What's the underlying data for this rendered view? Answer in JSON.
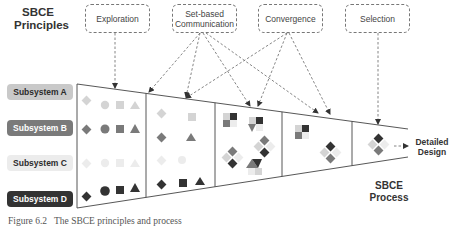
{
  "principles_title": "SBCE\nPrinciples",
  "principles_title_lines": [
    "SBCE",
    "Principles"
  ],
  "principles": [
    {
      "label": "Exploration"
    },
    {
      "label_lines": [
        "Set-based",
        "Communication"
      ]
    },
    {
      "label": "Convergence"
    },
    {
      "label": "Selection"
    }
  ],
  "subsystems": [
    {
      "label": "Subsystem A",
      "bg": "#c9c9c9",
      "fg": "#2b2b2b"
    },
    {
      "label": "Subsystem B",
      "bg": "#7a7a7a",
      "fg": "#ffffff"
    },
    {
      "label": "Subsystem C",
      "bg": "#ececec",
      "fg": "#2b2b2b"
    },
    {
      "label": "Subsystem D",
      "bg": "#333333",
      "fg": "#ffffff"
    }
  ],
  "output_label_lines": [
    "Detailed",
    "Design"
  ],
  "process_title_lines": [
    "SBCE",
    "Process"
  ],
  "caption": "Figure 6.2   The SBCE principles and process",
  "colors": {
    "shape_a": "#d4d4d4",
    "shape_b": "#7a7a7a",
    "shape_c": "#ececec",
    "shape_d": "#333333",
    "line": "#444444",
    "dashed": "#666666"
  }
}
